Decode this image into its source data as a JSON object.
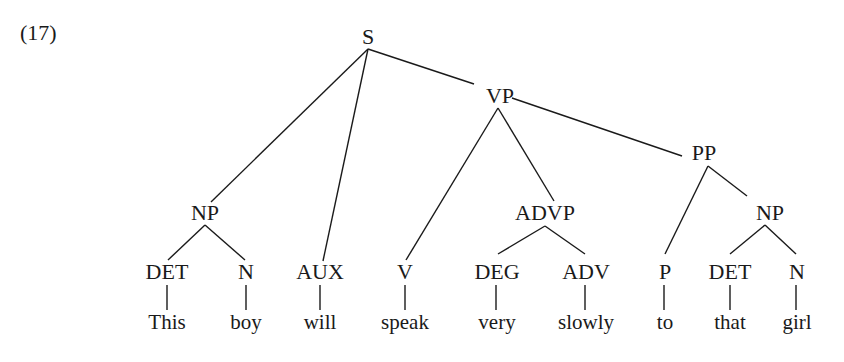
{
  "example_number": "(17)",
  "nodes": {
    "S": {
      "label": "S",
      "x": 368,
      "y": 37
    },
    "NP1": {
      "label": "NP",
      "x": 205,
      "y": 213
    },
    "AUX": {
      "label": "AUX",
      "x": 320,
      "y": 272
    },
    "VP": {
      "label": "VP",
      "x": 500,
      "y": 96
    },
    "V": {
      "label": "V",
      "x": 405,
      "y": 272
    },
    "ADVP": {
      "label": "ADVP",
      "x": 545,
      "y": 213
    },
    "PP": {
      "label": "PP",
      "x": 704,
      "y": 153
    },
    "NP2": {
      "label": "NP",
      "x": 770,
      "y": 213
    },
    "DET1": {
      "label": "DET",
      "x": 167,
      "y": 272
    },
    "N1": {
      "label": "N",
      "x": 246,
      "y": 272
    },
    "DEG": {
      "label": "DEG",
      "x": 497,
      "y": 272
    },
    "ADV": {
      "label": "ADV",
      "x": 586,
      "y": 272
    },
    "P": {
      "label": "P",
      "x": 665,
      "y": 272
    },
    "DET2": {
      "label": "DET",
      "x": 730,
      "y": 272
    },
    "N2": {
      "label": "N",
      "x": 797,
      "y": 272
    }
  },
  "words": [
    {
      "text": "This",
      "x": 167
    },
    {
      "text": "boy",
      "x": 246
    },
    {
      "text": "will",
      "x": 320
    },
    {
      "text": "speak",
      "x": 405
    },
    {
      "text": "very",
      "x": 497
    },
    {
      "text": "slowly",
      "x": 586
    },
    {
      "text": "to",
      "x": 665
    },
    {
      "text": "that",
      "x": 730
    },
    {
      "text": "girl",
      "x": 797
    }
  ],
  "sentence": "This boy will speak very slowly to that girl",
  "colors": {
    "ink": "#1a1a1a",
    "background": "#ffffff"
  }
}
